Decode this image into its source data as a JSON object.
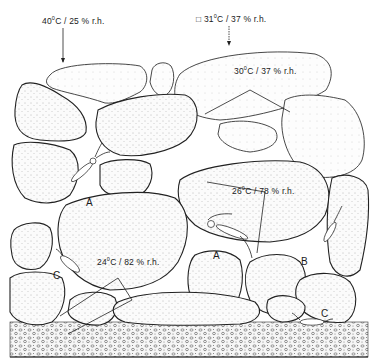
{
  "figure": {
    "type": "scientific-illustration",
    "colors": {
      "ink": "#222222",
      "background": "#ffffff",
      "stipple": "#555555"
    }
  },
  "labels": {
    "top_left": {
      "temp": "40",
      "rest": "C / 25 % r.h."
    },
    "top_right": {
      "prefix": "□",
      "temp": "31",
      "rest": "C / 37 % r.h."
    },
    "upper_stone": {
      "temp": "30",
      "rest": "C / 37 % r.h."
    },
    "middle_right": {
      "temp": "26",
      "rest": "C / 78 % r.h."
    },
    "lower_left": {
      "temp": "24",
      "rest": "C / 82 % r.h."
    },
    "degree_symbol": "0"
  },
  "specimens": [
    {
      "letter": "A",
      "position": "upper-left crevice"
    },
    {
      "letter": "A",
      "position": "middle crevice"
    },
    {
      "letter": "B",
      "position": "right crevice"
    },
    {
      "letter": "C",
      "position": "left crevice"
    },
    {
      "letter": "C",
      "position": "bottom right on soil"
    }
  ]
}
